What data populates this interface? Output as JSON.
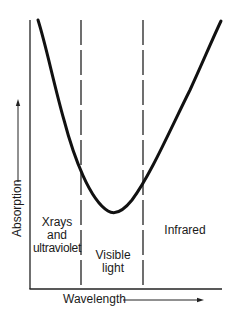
{
  "diagram": {
    "title": "",
    "type": "absorption-vs-wavelength",
    "axes": {
      "x_label": "Wavelength",
      "y_label": "Absorption",
      "x_arrow": true,
      "y_arrow": true
    },
    "regions": [
      {
        "id": "xray-uv",
        "lines": [
          "Xrays",
          "and",
          "ultraviolet"
        ]
      },
      {
        "id": "visible",
        "lines": [
          "Visible",
          "light"
        ]
      },
      {
        "id": "infrared",
        "lines": [
          "Infrared"
        ]
      }
    ],
    "boundaries": [
      "xray-uv | visible",
      "visible | infrared"
    ],
    "curve": {
      "shape": "U-shaped",
      "description": "Absorption is high at short wavelengths (X-rays/UV), drops to a minimum in the visible light region, and rises again in the infrared."
    },
    "colors": {
      "line": "#111111",
      "background": "#ffffff"
    }
  }
}
